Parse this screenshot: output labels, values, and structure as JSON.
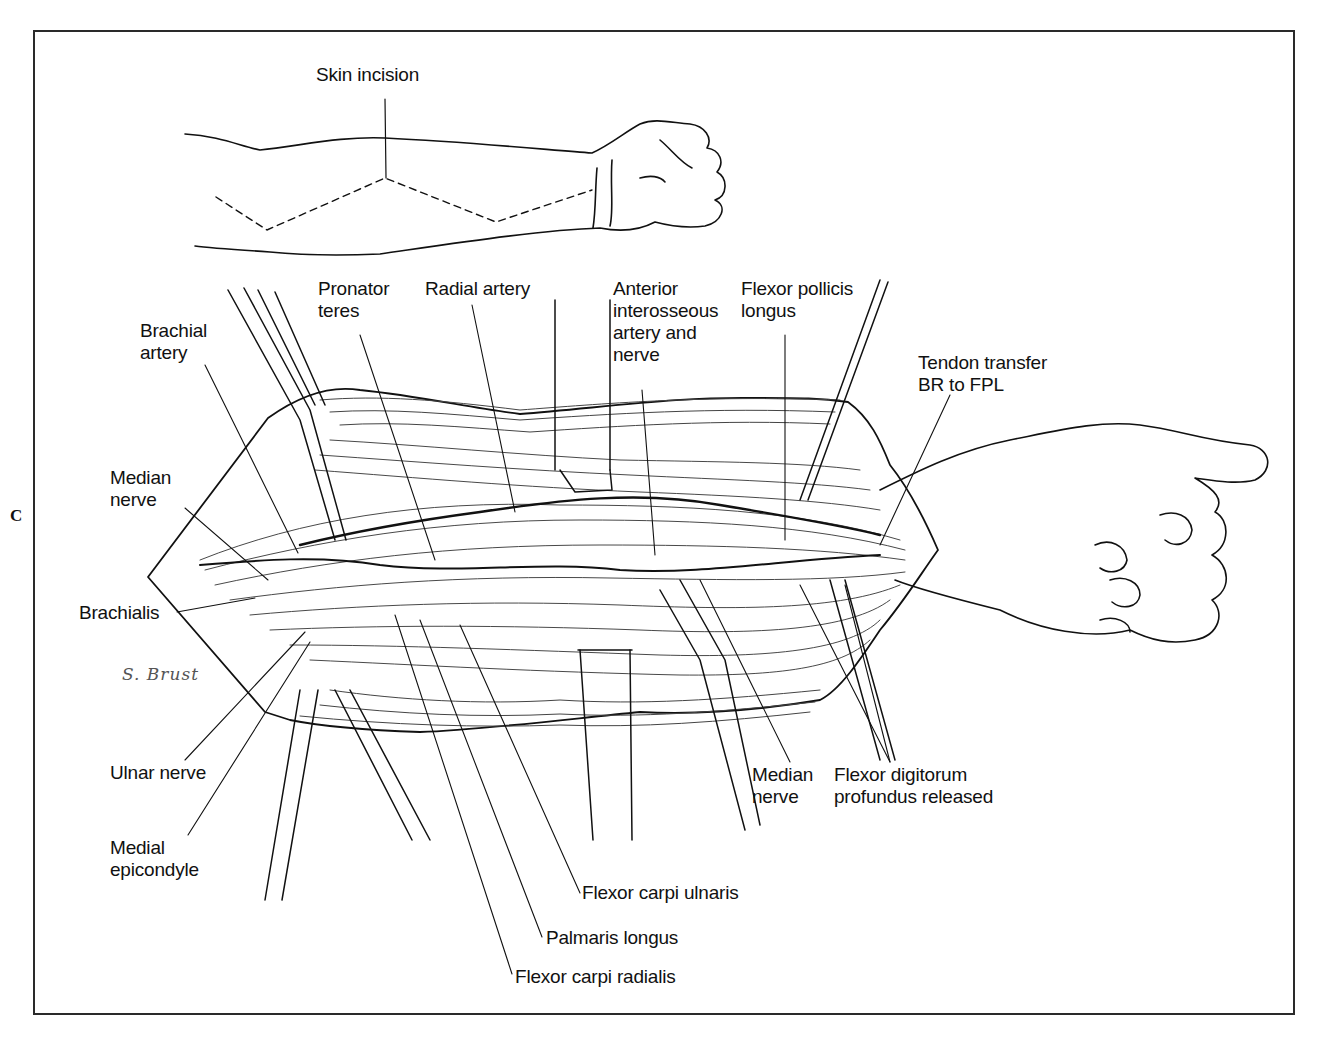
{
  "figure": {
    "panel_letter": "C",
    "signature": "S. Brust",
    "upper_panel": {
      "label": "Skin incision"
    },
    "labels": {
      "brachial_artery": [
        "Brachial",
        "artery"
      ],
      "pronator_teres": [
        "Pronator",
        "teres"
      ],
      "radial_artery": "Radial artery",
      "anterior_interosseous": [
        "Anterior",
        "interosseous",
        "artery and",
        "nerve"
      ],
      "flexor_pollicis_longus": [
        "Flexor pollicis",
        "longus"
      ],
      "tendon_transfer": [
        "Tendon transfer",
        "BR to FPL"
      ],
      "median_nerve_left": [
        "Median",
        "nerve"
      ],
      "brachialis": "Brachialis",
      "ulnar_nerve": "Ulnar nerve",
      "medial_epicondyle": [
        "Medial",
        "epicondyle"
      ],
      "median_nerve_right": [
        "Median",
        "nerve"
      ],
      "flexor_digitorum_profundus": [
        "Flexor digitorum",
        "profundus released"
      ],
      "flexor_carpi_ulnaris": "Flexor carpi ulnaris",
      "palmaris_longus": "Palmaris longus",
      "flexor_carpi_radialis": "Flexor carpi radialis"
    },
    "colors": {
      "line": "#111111",
      "frame": "#2a2a2a",
      "background": "#ffffff"
    }
  }
}
